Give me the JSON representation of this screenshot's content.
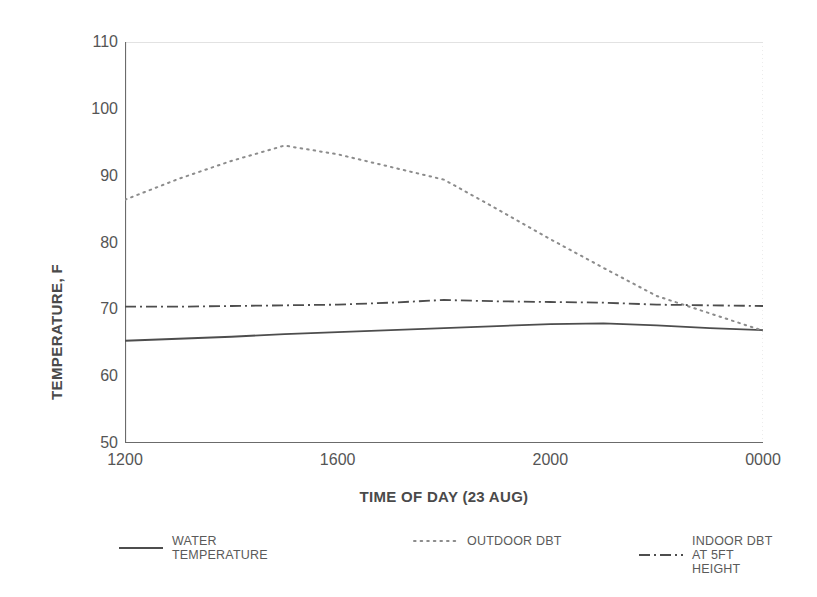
{
  "chart_data": {
    "type": "line",
    "title": "",
    "xlabel": "TIME OF DAY (23 AUG)",
    "ylabel": "TEMPERATURE, F",
    "xlim": [
      1200,
      2400
    ],
    "ylim": [
      50,
      110
    ],
    "yticks": [
      110,
      100,
      90,
      80,
      70,
      60,
      50
    ],
    "xticks": [
      1200,
      1600,
      2000,
      2400,
      2800,
      3200,
      3600
    ],
    "xticklabels": [
      "1200",
      "1600",
      "2000",
      "0000",
      "0400",
      "0800",
      "1200"
    ],
    "grid": "faint vertical gridline at 0000 only",
    "legend_position": "below axes, horizontal",
    "x": [
      1200,
      1300,
      1400,
      1500,
      1600,
      1700,
      1800,
      1900,
      2000,
      2100,
      2200,
      2300,
      2400,
      2500,
      2600,
      2700,
      2800,
      2900,
      3000,
      3100,
      3200,
      3300,
      3400,
      3500,
      3600
    ],
    "x_labels": [
      "1200",
      "1300",
      "1400",
      "1500",
      "1600",
      "1700",
      "1800",
      "1900",
      "2000",
      "2100",
      "2200",
      "2300",
      "0000",
      "0100",
      "0200",
      "0300",
      "0400",
      "0500",
      "0600",
      "0700",
      "0800",
      "0900",
      "1000",
      "1100",
      "1200"
    ],
    "series": [
      {
        "name": "WATER TEMPERATURE",
        "label_line1": "WATER",
        "label_line2": "TEMPERATURE",
        "style": "solid",
        "color": "#4d4d4d",
        "values": [
          65.3,
          65.6,
          65.9,
          66.3,
          66.6,
          66.9,
          67.2,
          67.5,
          67.8,
          67.9,
          67.6,
          67.2,
          66.9,
          66.5,
          66.1,
          65.8,
          65.6,
          65.4,
          65.3,
          65.3,
          65.4,
          65.4,
          65.5,
          65.7,
          65.9
        ]
      },
      {
        "name": "OUTDOOR DBT",
        "label_line1": "OUTDOOR DBT",
        "label_line2": "",
        "style": "dotted",
        "color": "#8c8c8c",
        "values": [
          86.4,
          89.5,
          92.2,
          94.5,
          93.2,
          91.3,
          89.4,
          85.0,
          80.5,
          76.2,
          72.0,
          69.4,
          66.8,
          64.2,
          61.5,
          58.8,
          57.0,
          55.8,
          55.2,
          56.5,
          62.0,
          67.5,
          72.5,
          78.0,
          86.0
        ]
      },
      {
        "name": "INDOOR DBT AT 5FT HEIGHT",
        "label_line1": "INDOOR DBT",
        "label_line2": "AT 5FT HEIGHT",
        "style": "dashdot",
        "color": "#4d4d4d",
        "values": [
          70.4,
          70.4,
          70.5,
          70.6,
          70.7,
          71.0,
          71.4,
          71.2,
          71.1,
          71.0,
          70.7,
          70.6,
          70.5,
          70.5,
          70.4,
          70.2,
          70.0,
          69.6,
          69.1,
          68.9,
          70.4,
          70.9,
          71.3,
          71.2,
          70.8
        ]
      }
    ]
  }
}
